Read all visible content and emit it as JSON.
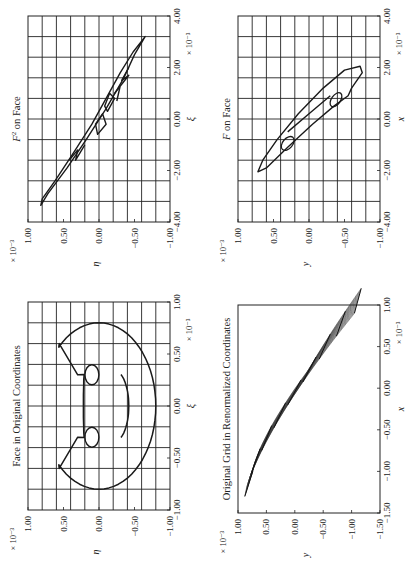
{
  "figure": {
    "orientation": "rotated 90 degrees counter-clockwise",
    "line_color": "#1a1a1a",
    "grid_color": "#222222"
  },
  "chart_data": [
    {
      "id": "face_original",
      "type": "line",
      "title": "Face in Original Coordinates",
      "xlabel": "ξ",
      "ylabel": "η",
      "x_multiplier": "× 10⁻³",
      "y_multiplier": "× 10⁻³",
      "xlim": [
        -1.0,
        1.0
      ],
      "ylim": [
        -1.0,
        1.0
      ],
      "xticks": [
        "−1.00",
        "−0.50",
        "0.00",
        "0.50",
        "1.00"
      ],
      "yticks": [
        "−1.00",
        "−0.50",
        "0.00",
        "0.50",
        "1.00"
      ],
      "grid": true,
      "grid_lines_x": 10,
      "grid_lines_y": 10,
      "shapes": [
        "head outline with two ear notches",
        "left eye circle at (−0.3, 0.1)",
        "right eye circle at (0.3, 0.1)",
        "mouth arc from (−0.3,−0.3) to (0.3,−0.3) via (0,−0.42)"
      ],
      "series": [
        {
          "name": "head",
          "x": [
            0.6,
            0.8,
            0.5,
            0.0,
            -0.5,
            -0.8,
            -0.6,
            -0.3,
            -0.2,
            0.0,
            0.2,
            0.3,
            0.6
          ],
          "y": [
            0.55,
            0.0,
            -0.55,
            -0.8,
            -0.55,
            0.0,
            0.55,
            0.3,
            0.2,
            0.2,
            0.2,
            0.3,
            0.55
          ]
        },
        {
          "name": "left_eye",
          "center": [
            -0.3,
            0.1
          ],
          "radius": 0.1
        },
        {
          "name": "right_eye",
          "center": [
            0.3,
            0.1
          ],
          "radius": 0.1
        },
        {
          "name": "mouth",
          "x": [
            -0.3,
            0.0,
            0.3
          ],
          "y": [
            -0.3,
            -0.42,
            -0.3
          ]
        }
      ]
    },
    {
      "id": "f_on_face",
      "type": "line",
      "title": "F on Face",
      "xlabel": "x",
      "ylabel": "y",
      "x_multiplier": "× 10⁻³",
      "y_multiplier": "× 10⁻³",
      "xlim": [
        -4.0,
        4.0
      ],
      "ylim": [
        -1.0,
        1.0
      ],
      "xticks": [
        "−4.00",
        "−2.00",
        "0.00",
        "2.00",
        "4.00"
      ],
      "yticks": [
        "−1.00",
        "−0.50",
        "0.00",
        "0.50",
        "1.00"
      ],
      "grid": true,
      "grid_lines_x": 10,
      "grid_lines_y": 10,
      "series": [
        {
          "name": "outline",
          "x": [
            -2.0,
            -1.2,
            0.0,
            1.0,
            2.0,
            1.4,
            1.0,
            0.0,
            -1.0,
            -2.0
          ],
          "y": [
            0.7,
            0.6,
            0.25,
            -0.1,
            -0.65,
            -0.8,
            -0.55,
            -0.1,
            0.25,
            0.7
          ]
        },
        {
          "name": "eye_left",
          "center": [
            -0.9,
            0.3
          ]
        },
        {
          "name": "eye_right",
          "center": [
            0.8,
            -0.4
          ]
        },
        {
          "name": "mouth",
          "x": [
            -0.6,
            0.9
          ],
          "y": [
            0.2,
            -0.3
          ]
        }
      ]
    },
    {
      "id": "f2_on_face",
      "type": "line",
      "title": "F² on Face",
      "xlabel": "ξ",
      "ylabel": "η",
      "x_multiplier": "× 10⁻³",
      "y_multiplier": "× 10⁻³",
      "xlim": [
        -4.0,
        4.0
      ],
      "ylim": [
        -1.0,
        1.0
      ],
      "xticks": [
        "−4.00",
        "−2.00",
        "0.00",
        "2.00",
        "4.00"
      ],
      "yticks": [
        "−1.00",
        "−0.50",
        "0.00",
        "0.50",
        "1.00"
      ],
      "grid": true,
      "grid_lines_x": 10,
      "grid_lines_y": 10,
      "series": [
        {
          "name": "outline",
          "x": [
            -3.4,
            -2.5,
            -0.5,
            1.0,
            2.0,
            3.2,
            2.0,
            1.5,
            0.8,
            0.0,
            -1.5,
            -3.4
          ],
          "y": [
            0.8,
            0.7,
            0.2,
            -0.2,
            -0.4,
            -0.65,
            -0.35,
            -0.15,
            0.0,
            0.05,
            0.35,
            0.8
          ]
        },
        {
          "name": "inner_shapes",
          "x": [
            -1.6,
            -1.0,
            0.5,
            1.0,
            1.5
          ],
          "y": [
            0.4,
            0.3,
            0.0,
            -0.2,
            -0.35
          ]
        }
      ]
    },
    {
      "id": "grid_renormalized",
      "type": "line",
      "title": "Original Grid in Renormalized Coordinates",
      "xlabel": "x",
      "ylabel": "y",
      "x_multiplier": "× 10⁻³",
      "y_multiplier": "× 10⁻³",
      "xlim": [
        -1.5,
        1.0
      ],
      "ylim": [
        -1.5,
        1.0
      ],
      "xticks": [
        "−1.50",
        "−1.00",
        "−0.50",
        "0.00",
        "0.50",
        "1.00"
      ],
      "yticks": [
        "−1.50",
        "−1.00",
        "−0.50",
        "0.00",
        "0.50",
        "1.00"
      ],
      "grid": false,
      "series": [
        {
          "name": "grid_band_upper",
          "x": [
            -1.3,
            -0.8,
            -0.3,
            0.2,
            0.6,
            0.9
          ],
          "y": [
            0.88,
            0.68,
            0.38,
            0.0,
            -0.5,
            -1.05
          ]
        },
        {
          "name": "grid_band_lower",
          "x": [
            -1.0,
            -0.5,
            0.0,
            0.5,
            0.9
          ],
          "y": [
            0.88,
            0.55,
            0.12,
            -0.38,
            -1.05
          ]
        }
      ]
    }
  ]
}
